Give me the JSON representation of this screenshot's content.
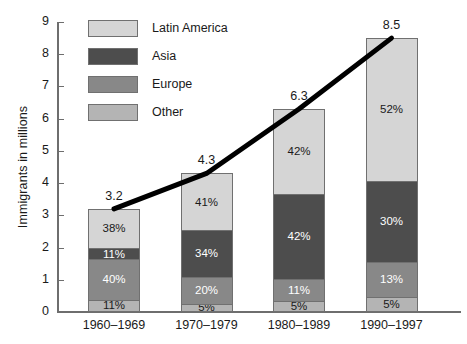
{
  "chart_data": {
    "type": "bar",
    "subtype": "stacked-bar-with-trend-line",
    "title": "",
    "xlabel": "",
    "ylabel": "Immigrants in millions",
    "ylim": [
      0,
      9
    ],
    "ytick_labels": [
      "0",
      "1",
      "2",
      "3",
      "4",
      "5",
      "6",
      "7",
      "8",
      "9"
    ],
    "grid": false,
    "legend_position": "top-left",
    "categories": [
      "1960–1969",
      "1970–1979",
      "1980–1989",
      "1990–1997"
    ],
    "totals": [
      3.2,
      4.3,
      6.3,
      8.5
    ],
    "total_labels": [
      "3.2",
      "4.3",
      "6.3",
      "8.5"
    ],
    "series": [
      {
        "name": "Latin America",
        "color": "#d5d5d5",
        "text_color": "#1a1a1a",
        "values": [
          38,
          41,
          42,
          52
        ],
        "labels": [
          "38%",
          "41%",
          "42%",
          "52%"
        ]
      },
      {
        "name": "Asia",
        "color": "#4d4d4d",
        "text_color": "#ffffff",
        "values": [
          11,
          34,
          42,
          30
        ],
        "labels": [
          "11%",
          "34%",
          "42%",
          "30%"
        ]
      },
      {
        "name": "Europe",
        "color": "#888888",
        "text_color": "#ffffff",
        "values": [
          40,
          20,
          11,
          13
        ],
        "labels": [
          "40%",
          "20%",
          "11%",
          "13%"
        ]
      },
      {
        "name": "Other",
        "color": "#b4b4b4",
        "text_color": "#1a1a1a",
        "values": [
          11,
          5,
          5,
          5
        ],
        "labels": [
          "11%",
          "5%",
          "5%",
          "5%"
        ]
      }
    ],
    "trend_line": {
      "name": "Total immigrants trend",
      "color": "#000000",
      "width": 5,
      "x": [
        "1960–1969",
        "1970–1979",
        "1980–1989",
        "1990–1997"
      ],
      "y": [
        3.2,
        4.3,
        6.3,
        8.5
      ]
    }
  },
  "axis": {
    "y_title": "Immigrants in millions",
    "y_ticks": [
      {
        "label": "9",
        "value": 9
      },
      {
        "label": "8",
        "value": 8
      },
      {
        "label": "7",
        "value": 7
      },
      {
        "label": "6",
        "value": 6
      },
      {
        "label": "5",
        "value": 5
      },
      {
        "label": "4",
        "value": 4
      },
      {
        "label": "3",
        "value": 3
      },
      {
        "label": "2",
        "value": 2
      },
      {
        "label": "1",
        "value": 1
      },
      {
        "label": "0",
        "value": 0
      }
    ]
  },
  "legend": {
    "items": [
      {
        "label": "Latin America",
        "color": "#d5d5d5"
      },
      {
        "label": "Asia",
        "color": "#4d4d4d"
      },
      {
        "label": "Europe",
        "color": "#888888"
      },
      {
        "label": "Other",
        "color": "#b4b4b4"
      }
    ]
  },
  "bars": [
    {
      "category": "1960–1969",
      "total_label": "3.2",
      "segments": [
        {
          "series": "Latin America",
          "label": "38%",
          "value": 38
        },
        {
          "series": "Asia",
          "label": "11%",
          "value": 11
        },
        {
          "series": "Europe",
          "label": "40%",
          "value": 40
        },
        {
          "series": "Other",
          "label": "11%",
          "value": 11
        }
      ]
    },
    {
      "category": "1970–1979",
      "total_label": "4.3",
      "segments": [
        {
          "series": "Latin America",
          "label": "41%",
          "value": 41
        },
        {
          "series": "Asia",
          "label": "34%",
          "value": 34
        },
        {
          "series": "Europe",
          "label": "20%",
          "value": 20
        },
        {
          "series": "Other",
          "label": "5%",
          "value": 5
        }
      ]
    },
    {
      "category": "1980–1989",
      "total_label": "6.3",
      "segments": [
        {
          "series": "Latin America",
          "label": "42%",
          "value": 42
        },
        {
          "series": "Asia",
          "label": "42%",
          "value": 42
        },
        {
          "series": "Europe",
          "label": "11%",
          "value": 11
        },
        {
          "series": "Other",
          "label": "5%",
          "value": 5
        }
      ]
    },
    {
      "category": "1990–1997",
      "total_label": "8.5",
      "segments": [
        {
          "series": "Latin America",
          "label": "52%",
          "value": 52
        },
        {
          "series": "Asia",
          "label": "30%",
          "value": 30
        },
        {
          "series": "Europe",
          "label": "13%",
          "value": 13
        },
        {
          "series": "Other",
          "label": "5%",
          "value": 5
        }
      ]
    }
  ]
}
